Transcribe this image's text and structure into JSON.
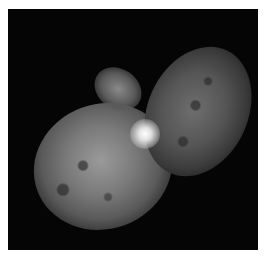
{
  "image": {
    "subject": "bipolar nebula (homunculus) around a bright central star",
    "background_color": "#050505",
    "page_background": "#ffffff"
  }
}
